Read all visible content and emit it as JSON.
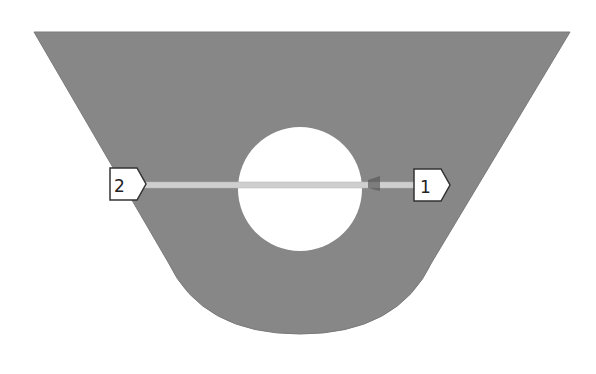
{
  "diagram": {
    "shape_fill": "#878787",
    "hole_fill": "#ffffff",
    "section_line_color": "#c8c8c8",
    "markers": [
      {
        "id": "1",
        "label": "1"
      },
      {
        "id": "2",
        "label": "2"
      }
    ]
  }
}
